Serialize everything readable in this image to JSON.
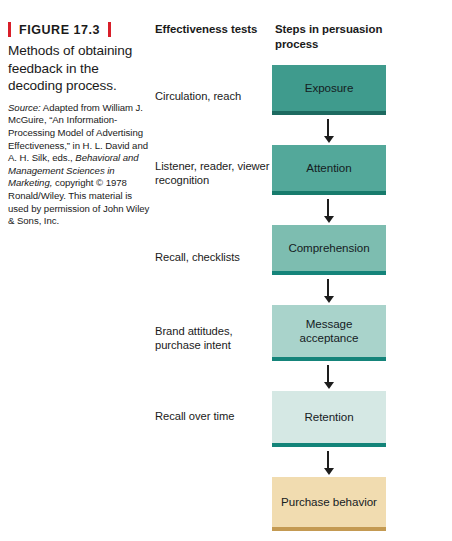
{
  "figure": {
    "label": "FIGURE 17.3",
    "title": "Methods of obtaining feedback in the decoding process.",
    "source_lead": "Source:",
    "source_text_1": " Adapted from William J. McGuire, “An Information-Processing Model of Advertising Effectiveness,” in H. L. David and A. H. Silk, eds., ",
    "source_italic": "Behavioral and Management Sciences in Marketing,",
    "source_text_2": " copyright © 1978 Ronald/Wiley. This material is used by permission of John Wiley & Sons, Inc.",
    "accent_color": "#d81f2a"
  },
  "columns": {
    "tests_heading": "Effectiveness tests",
    "steps_heading": "Steps in persuasion process"
  },
  "rows": [
    {
      "test": "Circulation, reach",
      "step": "Exposure",
      "color": "#3f9b8d",
      "edge": "#1d6a60"
    },
    {
      "test": "Listener, reader, viewer recognition",
      "step": "Attention",
      "color": "#53a89a",
      "edge": "#177b6c"
    },
    {
      "test": "Recall, checklists",
      "step": "Comprehension",
      "color": "#7dbdb0",
      "edge": "#15847a"
    },
    {
      "test": "Brand attitudes, purchase intent",
      "step": "Message acceptance",
      "color": "#a9d3cb",
      "edge": "#15847a"
    },
    {
      "test": "Recall over time",
      "step": "Retention",
      "color": "#d5e8e4",
      "edge": "#138479"
    },
    {
      "test": "",
      "step": "Purchase behavior",
      "color": "#f1dcb0",
      "edge": "#c49a52"
    }
  ]
}
